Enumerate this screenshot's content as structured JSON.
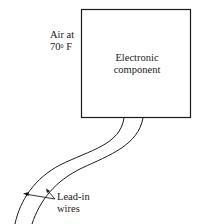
{
  "diagram": {
    "ambient_label_line1": "Air at",
    "ambient_label_line2_value": "70",
    "ambient_label_line2_degree": "0",
    "ambient_label_line2_unit": " F",
    "component_label_line1": "Electronic",
    "component_label_line2": "component",
    "wires_label_line1": "Lead-in",
    "wires_label_line2": "wires"
  }
}
